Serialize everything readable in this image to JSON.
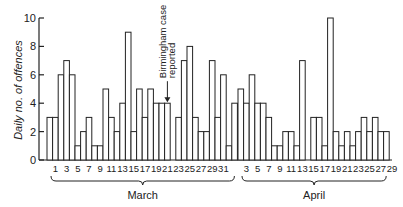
{
  "chart_data": {
    "type": "bar",
    "title": "",
    "ylabel": "Daily no. of offences",
    "xlabel": "",
    "ylim": [
      0,
      10
    ],
    "yticks": [
      0,
      2,
      4,
      6,
      8,
      10
    ],
    "grid": false,
    "groups": [
      {
        "name": "March",
        "tick_labels": [
          "1",
          "3",
          "5",
          "7",
          "9",
          "11",
          "13",
          "15",
          "17",
          "19",
          "21",
          "23",
          "25",
          "27",
          "29",
          "31"
        ],
        "values": [
          3,
          3,
          6,
          7,
          6,
          1,
          2,
          3,
          1,
          1,
          5,
          3,
          2,
          4,
          9,
          2,
          5,
          3,
          5,
          4,
          4,
          4,
          0,
          3,
          7,
          8,
          3,
          2,
          2,
          7,
          3,
          6,
          1,
          4
        ]
      },
      {
        "name": "April",
        "tick_labels": [
          "3",
          "5",
          "7",
          "9",
          "11",
          "13",
          "15",
          "17",
          "19",
          "21",
          "23",
          "25",
          "27",
          "29"
        ],
        "values": [
          5,
          4,
          6,
          4,
          4,
          3,
          1,
          1,
          2,
          2,
          1,
          7,
          0,
          3,
          3,
          1,
          10,
          2,
          1,
          2,
          1,
          2,
          3,
          2,
          3,
          2,
          2
        ]
      }
    ],
    "annotations": [
      {
        "text_lines": [
          "Birmingham case",
          "reported"
        ],
        "points_to": "March 21",
        "marker": "down-arrow"
      }
    ]
  }
}
